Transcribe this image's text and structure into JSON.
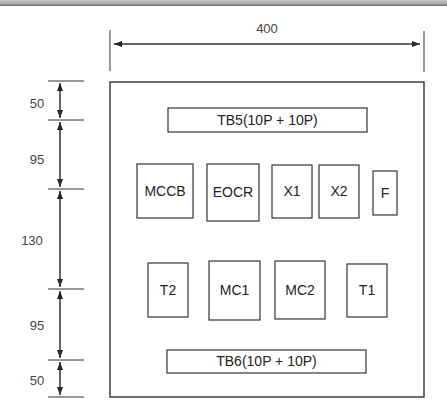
{
  "diagram": {
    "title": "",
    "width_dimension": "400",
    "vertical_dimensions": [
      "50",
      "95",
      "130",
      "95",
      "50"
    ],
    "components": {
      "tb5": "TB5(10P + 10P)",
      "mccb": "MCCB",
      "eocr": "EOCR",
      "x1": "X1",
      "x2": "X2",
      "f": "F",
      "t2": "T2",
      "mc1": "MC1",
      "mc2": "MC2",
      "t1": "T1",
      "tb6": "TB6(10P + 10P)"
    },
    "colors": {
      "line": "#333333",
      "text": "#222222",
      "background": "#ffffff"
    }
  }
}
